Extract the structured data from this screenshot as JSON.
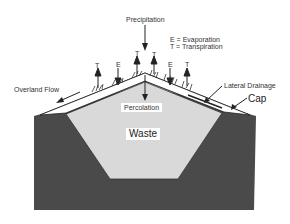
{
  "diagram": {
    "labels": {
      "precipitation": "Precipitation",
      "legend_e": "E = Evaporation",
      "legend_t": "T = Transpiration",
      "overland_flow": "Overland Flow",
      "lateral_drainage": "Lateral Drainage",
      "cap": "Cap",
      "percolation": "Percolation",
      "waste": "Waste"
    },
    "markers": [
      {
        "letter": "T"
      },
      {
        "letter": "E"
      },
      {
        "letter": "T"
      },
      {
        "letter": "T"
      },
      {
        "letter": "E"
      },
      {
        "letter": "T"
      }
    ],
    "colors": {
      "ground": "#4a4a4a",
      "waste": "#d9d9d9",
      "cap": "#ffffff",
      "line": "#222222"
    }
  }
}
